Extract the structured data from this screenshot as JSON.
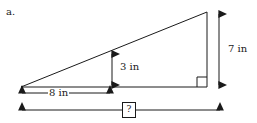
{
  "figure": {
    "part_label": "a.",
    "shape": "right-triangle",
    "colors": {
      "stroke": "#1a1a1a",
      "background": "#ffffff",
      "text": "#1a1a1a"
    },
    "dimensions": [
      {
        "id": "height_full",
        "value": "7 in",
        "orientation": "vertical",
        "position": "right"
      },
      {
        "id": "height_inner",
        "value": "3 in",
        "orientation": "vertical",
        "position": "interior"
      },
      {
        "id": "base_inner",
        "value": "8 in",
        "orientation": "horizontal",
        "position": "below-base"
      },
      {
        "id": "base_full",
        "value": "?",
        "orientation": "horizontal",
        "position": "bottom"
      }
    ],
    "right_angle_marker": true
  }
}
